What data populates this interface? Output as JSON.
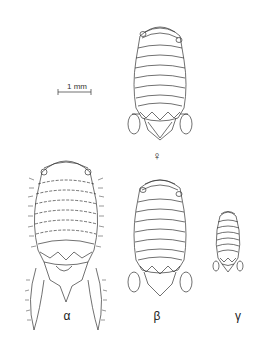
{
  "figure": {
    "scale_bar": {
      "label": "1 mm"
    },
    "specimens": [
      {
        "id": "female",
        "label": "♀"
      },
      {
        "id": "alpha",
        "label": "α"
      },
      {
        "id": "beta",
        "label": "β"
      },
      {
        "id": "gamma",
        "label": "γ"
      }
    ]
  },
  "colors": {
    "ink": "#222222",
    "background": "#ffffff"
  }
}
